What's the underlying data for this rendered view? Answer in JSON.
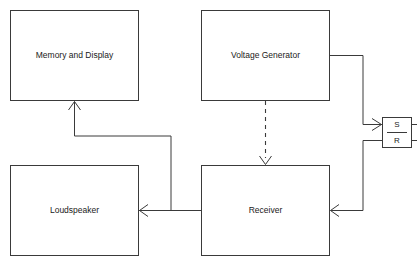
{
  "diagram": {
    "width": 420,
    "height": 264,
    "background_color": "#ffffff",
    "line_color": "#3a3a3a",
    "text_color": "#1a1a1a",
    "blocks": [
      {
        "id": "memory-and-display",
        "label": "Memory and Display",
        "x": 10,
        "y": 10,
        "w": 129,
        "h": 91,
        "cx": 74.5,
        "cy": 55.5
      },
      {
        "id": "voltage-generator",
        "label": "Voltage Generator",
        "x": 201,
        "y": 10,
        "w": 129,
        "h": 91,
        "cx": 265.5,
        "cy": 55.5
      },
      {
        "id": "loudspeaker",
        "label": "Loudspeaker",
        "x": 10,
        "y": 165,
        "w": 129,
        "h": 91,
        "cx": 74.5,
        "cy": 210.5
      },
      {
        "id": "receiver",
        "label": "Receiver",
        "x": 201,
        "y": 165,
        "w": 129,
        "h": 91,
        "cx": 265.5,
        "cy": 210.5
      }
    ],
    "latch": {
      "id": "sr-latch",
      "set_label": "S",
      "reset_label": "R",
      "x": 382,
      "y": 117,
      "w": 30,
      "h": 31,
      "divider_y": 132.5,
      "set_cx": 397,
      "set_cy": 124.5,
      "reset_cx": 397,
      "reset_cy": 140.5
    },
    "connections": [
      {
        "id": "receiver-to-loudspeaker",
        "from": "receiver",
        "to": "loudspeaker",
        "style": "solid",
        "arrow": "left",
        "path": "M 201 210.5 L 139 210.5"
      },
      {
        "id": "receiver-to-memory-and-display",
        "from": "receiver",
        "to": "memory-and-display",
        "style": "solid",
        "arrow": "up",
        "path": "M 171 210.5 L 171 136 L 74.5 136 L 74.5 101"
      },
      {
        "id": "voltage-generator-to-receiver",
        "from": "voltage-generator",
        "to": "receiver",
        "style": "dashed",
        "arrow": "down",
        "path": "M 265.5 101 L 265.5 165"
      },
      {
        "id": "voltage-generator-to-sr-latch-set",
        "from": "voltage-generator",
        "to": "sr-latch",
        "style": "solid",
        "arrow": "right",
        "path": "M 330 55.5 L 363 55.5 L 363 124.5 L 382 124.5"
      },
      {
        "id": "sr-latch-reset-to-receiver",
        "from": "sr-latch",
        "to": "receiver",
        "style": "solid",
        "arrow": "left",
        "path": "M 382 140.5 L 363 140.5 L 363 210.5 L 330 210.5"
      }
    ]
  }
}
